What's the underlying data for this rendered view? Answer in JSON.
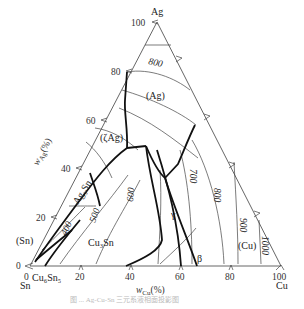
{
  "diagram": {
    "type": "ternary phase diagram (liquidus projection)",
    "vertices": {
      "top": "Ag",
      "left": "Sn",
      "right": "Cu"
    },
    "axes": {
      "left_label": "w_Ag(%)",
      "bottom_label": "w_Cu(%)",
      "left_ticks": [
        "0",
        "20",
        "40",
        "60",
        "80",
        "100"
      ],
      "bottom_ticks": [
        "0",
        "20",
        "40",
        "60",
        "80",
        "100"
      ]
    },
    "phase_labels": [
      "(Ag)",
      "(ζAg)",
      "Ag3Sn",
      "(Sn)",
      "Cu6Sn5",
      "Cu3Sn",
      "γ",
      "β",
      "(Cu)"
    ],
    "isotherms": [
      "400",
      "500",
      "600",
      "700",
      "800",
      "800",
      "900",
      "1000"
    ],
    "caption": "图 ... Ag-Cu-Sn 三元系液相面投影图"
  },
  "labels": {
    "ag": "Ag",
    "sn": "Sn",
    "cu": "Cu",
    "ag_axis": "w",
    "ag_axis_sub": "Ag",
    "ag_axis_pct": "(%)",
    "cu_axis": "w",
    "cu_axis_sub": "Cu",
    "cu_axis_pct": "(%)",
    "t0": "0",
    "t20": "20",
    "t40": "40",
    "t60": "60",
    "t80": "80",
    "t100": "100",
    "b0": "0",
    "b20": "20",
    "b40": "40",
    "b60": "60",
    "b80": "80",
    "b100": "100",
    "p_ag": "(Ag)",
    "p_zag": "(ζAg)",
    "p_ag3sn": "Ag₃Sn",
    "p_sn": "(Sn)",
    "p_cu6sn5": "Cu₆Sn₅",
    "p_cu3sn": "Cu₃Sn",
    "p_gamma": "γ",
    "p_beta": "β",
    "p_cu": "(Cu)",
    "i400": "400",
    "i500": "500",
    "i600": "600",
    "i700": "700",
    "i800a": "800",
    "i800b": "800",
    "i900": "900",
    "i1000": "1000"
  }
}
